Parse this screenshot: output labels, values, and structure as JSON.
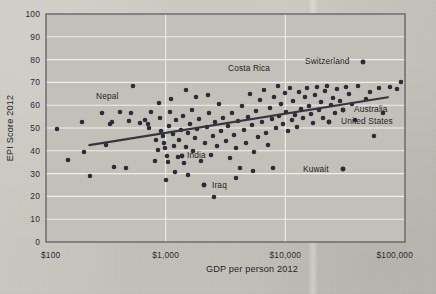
{
  "figure": {
    "background_color": "#c9c6bf",
    "plot_background_color": "#c3c0b9",
    "gridline_color": "#efeee9",
    "point_color": "#2b2b3a",
    "trendline_color": "#35353f",
    "axis_color": "#55555e"
  },
  "axes": {
    "y_title": "EPI Score 2012",
    "x_title": "GDP per person 2012",
    "y_ticks": [
      "0",
      "10",
      "20",
      "30",
      "40",
      "50",
      "60",
      "70",
      "80",
      "90",
      "100"
    ],
    "x_ticks": [
      "$100",
      "$1,000",
      "$10,000",
      "$100,000"
    ]
  },
  "annotations": [
    {
      "label": "Nepal",
      "lx": 96,
      "ly": 99,
      "anchor": "start",
      "dot": null
    },
    {
      "label": "Costa Rica",
      "lx": 228,
      "ly": 71,
      "anchor": "start",
      "dot": null
    },
    {
      "label": "Switzerland",
      "lx": 305,
      "ly": 64,
      "anchor": "start",
      "dot": {
        "x": 363,
        "y": 62
      }
    },
    {
      "label": "Australia",
      "lx": 354,
      "ly": 112,
      "anchor": "start",
      "dot": {
        "x": 343,
        "y": 110
      }
    },
    {
      "label": "United States",
      "lx": 341,
      "ly": 124,
      "anchor": "start",
      "dot": {
        "x": 329,
        "y": 122
      }
    },
    {
      "label": "India",
      "lx": 187,
      "ly": 158,
      "anchor": "start",
      "dot": {
        "x": 182,
        "y": 156
      }
    },
    {
      "label": "Iraq",
      "lx": 212,
      "ly": 188,
      "anchor": "start",
      "dot": {
        "x": 204,
        "y": 185
      }
    },
    {
      "label": "Kuwait",
      "lx": 303,
      "ly": 172,
      "anchor": "start",
      "dot": {
        "x": 343,
        "y": 169
      }
    }
  ],
  "chart_data": {
    "type": "scatter",
    "title": "",
    "xlabel": "GDP per person 2012",
    "ylabel": "EPI Score 2012",
    "xscale": "log",
    "xlim": [
      100,
      100000
    ],
    "ylim": [
      0,
      100
    ],
    "x_tick_values": [
      100,
      1000,
      10000,
      100000
    ],
    "x_tick_labels": [
      "$100",
      "$1,000",
      "$10,000",
      "$100,000"
    ],
    "y_tick_values": [
      0,
      10,
      20,
      30,
      40,
      50,
      60,
      70,
      80,
      90,
      100
    ],
    "grid": "horizontal-and-vertical",
    "legend": "none",
    "trendline": {
      "type": "linear-on-log-x",
      "x_start": 230,
      "y_start": 42.5,
      "x_end": 72000,
      "y_end": 63.5
    },
    "labeled_points": [
      {
        "name": "Nepal",
        "gdp": 700,
        "epi": 57.9
      },
      {
        "name": "Costa Rica",
        "gdp": 8800,
        "epi": 69.0
      },
      {
        "name": "Switzerland",
        "gdp": 45000,
        "epi": 76.7
      },
      {
        "name": "Australia",
        "gdp": 33000,
        "epi": 56.6
      },
      {
        "name": "United States",
        "gdp": 25000,
        "epi": 56.6
      },
      {
        "name": "India",
        "gdp": 1500,
        "epi": 36.2
      },
      {
        "name": "Iraq",
        "gdp": 3200,
        "epi": 25.3
      },
      {
        "name": "Kuwait",
        "gdp": 33000,
        "epi": 35.5
      }
    ],
    "points": [
      {
        "px": 57,
        "py": 129
      },
      {
        "px": 82,
        "py": 122
      },
      {
        "px": 84,
        "py": 152
      },
      {
        "px": 102,
        "py": 113
      },
      {
        "px": 106,
        "py": 145
      },
      {
        "px": 112,
        "py": 122
      },
      {
        "px": 110,
        "py": 124
      },
      {
        "px": 114,
        "py": 167
      },
      {
        "px": 120,
        "py": 112
      },
      {
        "px": 126,
        "py": 168
      },
      {
        "px": 129,
        "py": 121
      },
      {
        "px": 131,
        "py": 113
      },
      {
        "px": 133,
        "py": 86
      },
      {
        "px": 140,
        "py": 123
      },
      {
        "px": 145,
        "py": 120
      },
      {
        "px": 148,
        "py": 124
      },
      {
        "px": 149,
        "py": 128
      },
      {
        "px": 151,
        "py": 112
      },
      {
        "px": 155,
        "py": 161
      },
      {
        "px": 156,
        "py": 140
      },
      {
        "px": 158,
        "py": 150
      },
      {
        "px": 159,
        "py": 103
      },
      {
        "px": 160,
        "py": 118
      },
      {
        "px": 161,
        "py": 131
      },
      {
        "px": 163,
        "py": 136
      },
      {
        "px": 164,
        "py": 143
      },
      {
        "px": 165,
        "py": 148
      },
      {
        "px": 167,
        "py": 156
      },
      {
        "px": 168,
        "py": 162
      },
      {
        "px": 169,
        "py": 126
      },
      {
        "px": 170,
        "py": 112
      },
      {
        "px": 171,
        "py": 99
      },
      {
        "px": 173,
        "py": 134
      },
      {
        "px": 174,
        "py": 146
      },
      {
        "px": 176,
        "py": 120
      },
      {
        "px": 178,
        "py": 157
      },
      {
        "px": 179,
        "py": 140
      },
      {
        "px": 181,
        "py": 130
      },
      {
        "px": 183,
        "py": 116
      },
      {
        "px": 184,
        "py": 163
      },
      {
        "px": 186,
        "py": 147
      },
      {
        "px": 188,
        "py": 133
      },
      {
        "px": 190,
        "py": 124
      },
      {
        "px": 192,
        "py": 110
      },
      {
        "px": 193,
        "py": 151
      },
      {
        "px": 195,
        "py": 138
      },
      {
        "px": 197,
        "py": 129
      },
      {
        "px": 199,
        "py": 119
      },
      {
        "px": 201,
        "py": 161
      },
      {
        "px": 204,
        "py": 185
      },
      {
        "px": 205,
        "py": 143
      },
      {
        "px": 207,
        "py": 127
      },
      {
        "px": 209,
        "py": 113
      },
      {
        "px": 211,
        "py": 155
      },
      {
        "px": 213,
        "py": 136
      },
      {
        "px": 215,
        "py": 122
      },
      {
        "px": 217,
        "py": 146
      },
      {
        "px": 219,
        "py": 104
      },
      {
        "px": 221,
        "py": 131
      },
      {
        "px": 223,
        "py": 118
      },
      {
        "px": 226,
        "py": 141
      },
      {
        "px": 228,
        "py": 126
      },
      {
        "px": 230,
        "py": 158
      },
      {
        "px": 232,
        "py": 113
      },
      {
        "px": 234,
        "py": 135
      },
      {
        "px": 236,
        "py": 148
      },
      {
        "px": 238,
        "py": 121
      },
      {
        "px": 240,
        "py": 168
      },
      {
        "px": 242,
        "py": 106
      },
      {
        "px": 244,
        "py": 130
      },
      {
        "px": 246,
        "py": 143
      },
      {
        "px": 248,
        "py": 117
      },
      {
        "px": 250,
        "py": 94
      },
      {
        "px": 252,
        "py": 125
      },
      {
        "px": 254,
        "py": 152
      },
      {
        "px": 256,
        "py": 111
      },
      {
        "px": 258,
        "py": 137
      },
      {
        "px": 260,
        "py": 100
      },
      {
        "px": 262,
        "py": 122
      },
      {
        "px": 264,
        "py": 90
      },
      {
        "px": 266,
        "py": 133
      },
      {
        "px": 268,
        "py": 145
      },
      {
        "px": 270,
        "py": 108
      },
      {
        "px": 272,
        "py": 119
      },
      {
        "px": 274,
        "py": 97
      },
      {
        "px": 276,
        "py": 128
      },
      {
        "px": 278,
        "py": 86
      },
      {
        "px": 279,
        "py": 116
      },
      {
        "px": 281,
        "py": 104
      },
      {
        "px": 283,
        "py": 124
      },
      {
        "px": 285,
        "py": 93
      },
      {
        "px": 286,
        "py": 112
      },
      {
        "px": 288,
        "py": 131
      },
      {
        "px": 290,
        "py": 88
      },
      {
        "px": 292,
        "py": 120
      },
      {
        "px": 293,
        "py": 101
      },
      {
        "px": 295,
        "py": 115
      },
      {
        "px": 297,
        "py": 127
      },
      {
        "px": 299,
        "py": 92
      },
      {
        "px": 301,
        "py": 109
      },
      {
        "px": 303,
        "py": 118
      },
      {
        "px": 305,
        "py": 97
      },
      {
        "px": 307,
        "py": 88
      },
      {
        "px": 309,
        "py": 106
      },
      {
        "px": 311,
        "py": 114
      },
      {
        "px": 313,
        "py": 123
      },
      {
        "px": 315,
        "py": 95
      },
      {
        "px": 317,
        "py": 87
      },
      {
        "px": 319,
        "py": 110
      },
      {
        "px": 321,
        "py": 102
      },
      {
        "px": 323,
        "py": 118
      },
      {
        "px": 325,
        "py": 91
      },
      {
        "px": 327,
        "py": 86
      },
      {
        "px": 329,
        "py": 122
      },
      {
        "px": 331,
        "py": 105
      },
      {
        "px": 333,
        "py": 98
      },
      {
        "px": 335,
        "py": 113
      },
      {
        "px": 337,
        "py": 89
      },
      {
        "px": 340,
        "py": 101
      },
      {
        "px": 343,
        "py": 110
      },
      {
        "px": 343,
        "py": 169
      },
      {
        "px": 346,
        "py": 87
      },
      {
        "px": 349,
        "py": 94
      },
      {
        "px": 352,
        "py": 104
      },
      {
        "px": 355,
        "py": 120
      },
      {
        "px": 358,
        "py": 86
      },
      {
        "px": 363,
        "py": 62
      },
      {
        "px": 366,
        "py": 99
      },
      {
        "px": 370,
        "py": 92
      },
      {
        "px": 374,
        "py": 136
      },
      {
        "px": 379,
        "py": 88
      },
      {
        "px": 383,
        "py": 113
      },
      {
        "px": 390,
        "py": 87
      },
      {
        "px": 397,
        "py": 89
      },
      {
        "px": 401,
        "py": 82
      },
      {
        "px": 186,
        "py": 90
      },
      {
        "px": 196,
        "py": 97
      },
      {
        "px": 208,
        "py": 95
      },
      {
        "px": 175,
        "py": 172
      },
      {
        "px": 188,
        "py": 175
      },
      {
        "px": 253,
        "py": 171
      },
      {
        "px": 273,
        "py": 168
      },
      {
        "px": 166,
        "py": 180
      },
      {
        "px": 236,
        "py": 178
      },
      {
        "px": 214,
        "py": 197
      },
      {
        "px": 90,
        "py": 176
      },
      {
        "px": 68,
        "py": 160
      }
    ]
  }
}
